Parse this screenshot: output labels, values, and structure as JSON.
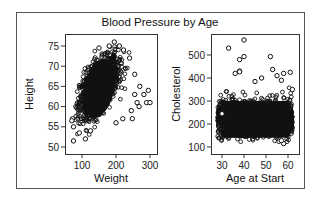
{
  "figure": {
    "title": "Blood Pressure by Age"
  },
  "chart_data": [
    {
      "type": "scatter",
      "title": "Blood Pressure by Age",
      "panel": "left",
      "xlabel": "Weight",
      "ylabel": "Height",
      "xlim": [
        55,
        320
      ],
      "ylim": [
        48,
        77
      ],
      "xticks": [
        100,
        200,
        300
      ],
      "yticks": [
        50,
        55,
        60,
        65,
        70,
        75
      ],
      "grid": false,
      "marker": "open-circle",
      "cloud": {
        "x_center": 150,
        "y_center": 65,
        "x_spread": 28,
        "y_spread": 3.5,
        "correlation": 0.55
      },
      "points": [
        [
          75,
          51.5
        ],
        [
          72,
          57
        ],
        [
          70,
          56.5
        ],
        [
          75,
          55
        ],
        [
          92,
          53.5
        ],
        [
          110,
          52
        ],
        [
          125,
          54
        ],
        [
          150,
          74.5
        ],
        [
          180,
          75
        ],
        [
          195,
          76
        ],
        [
          210,
          75
        ],
        [
          222,
          74
        ],
        [
          240,
          72
        ],
        [
          255,
          68
        ],
        [
          270,
          65
        ],
        [
          282,
          63
        ],
        [
          295,
          64
        ],
        [
          290,
          61
        ],
        [
          300,
          61
        ],
        [
          255,
          63
        ],
        [
          262,
          61
        ],
        [
          268,
          60
        ],
        [
          245,
          59
        ],
        [
          248,
          57
        ],
        [
          220,
          57
        ],
        [
          200,
          56
        ]
      ]
    },
    {
      "type": "scatter",
      "panel": "right",
      "xlabel": "Age at Start",
      "ylabel": "Cholesterol",
      "xlim": [
        25,
        64
      ],
      "ylim": [
        90,
        580
      ],
      "xticks": [
        30,
        40,
        50,
        60
      ],
      "yticks": [
        100,
        200,
        300,
        400,
        500
      ],
      "grid": false,
      "marker": "open-circle",
      "cloud": {
        "x_range": [
          28,
          62
        ],
        "y_center": 225,
        "y_spread": 40
      },
      "points": [
        [
          33,
          530
        ],
        [
          40,
          565
        ],
        [
          38,
          480
        ],
        [
          40,
          493
        ],
        [
          52,
          493
        ],
        [
          36,
          420
        ],
        [
          38,
          430
        ],
        [
          38,
          427
        ],
        [
          48,
          400
        ],
        [
          53,
          437
        ],
        [
          55,
          410
        ],
        [
          58,
          420
        ],
        [
          61,
          425
        ],
        [
          62,
          350
        ],
        [
          57,
          390
        ],
        [
          45,
          385
        ],
        [
          30,
          245
        ],
        [
          58,
          115
        ],
        [
          57,
          128
        ]
      ]
    }
  ]
}
